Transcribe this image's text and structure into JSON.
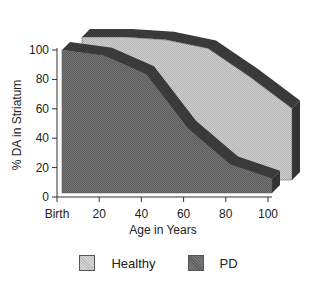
{
  "chart_data": {
    "type": "area",
    "title": "",
    "xlabel": "Age in Years",
    "ylabel": "% DA in Striatum",
    "categories": [
      "Birth",
      "20",
      "40",
      "60",
      "80",
      "100"
    ],
    "x": [
      0,
      20,
      40,
      60,
      80,
      100
    ],
    "series": [
      {
        "name": "Healthy",
        "values": [
          100,
          100,
          98,
          92,
          72,
          50
        ],
        "color": "#c8c8c8"
      },
      {
        "name": "PD",
        "values": [
          100,
          96,
          83,
          45,
          20,
          10
        ],
        "color": "#6e6e6e"
      }
    ],
    "yticks": [
      0,
      20,
      40,
      60,
      80,
      100
    ],
    "ylim": [
      0,
      100
    ],
    "grid": false,
    "legend_position": "bottom",
    "style": "3d-area"
  },
  "legend": {
    "items": [
      {
        "label": "Healthy"
      },
      {
        "label": "PD"
      }
    ]
  }
}
